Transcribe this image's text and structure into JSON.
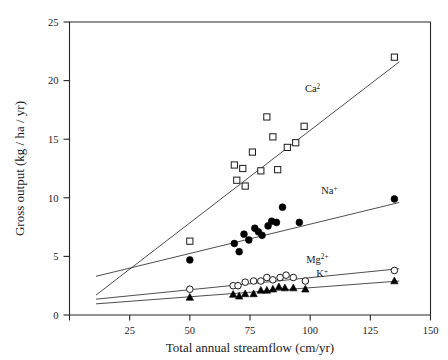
{
  "chart_data": {
    "type": "scatter",
    "title": "",
    "xlabel": "Total annual streamflow (cm/yr)",
    "ylabel": "Gross output (kg / ha / yr)",
    "xlim": [
      0,
      150
    ],
    "ylim": [
      0,
      25
    ],
    "xticks": [
      0,
      25,
      50,
      75,
      100,
      125,
      150
    ],
    "xticklabels": [
      "",
      "25",
      "50",
      "75",
      "100",
      "125",
      "150"
    ],
    "yticks": [
      0,
      5,
      10,
      15,
      20,
      25
    ],
    "yticklabels": [
      "0",
      "5",
      "10",
      "15",
      "20",
      "25"
    ],
    "grid": false,
    "legend_position": "inline-annotations",
    "series": [
      {
        "name": "Ca2",
        "label_text": "Ca",
        "label_sup": "2",
        "marker": "open-square",
        "label_x": 101,
        "label_y": 19.0,
        "trendline": {
          "x0": 11,
          "y0": 1.7,
          "x1": 137,
          "y1": 21.6
        },
        "points": [
          {
            "x": 50.0,
            "y": 6.3
          },
          {
            "x": 68.5,
            "y": 12.8
          },
          {
            "x": 69.5,
            "y": 11.5
          },
          {
            "x": 72.0,
            "y": 12.5
          },
          {
            "x": 73.0,
            "y": 11.0
          },
          {
            "x": 76.0,
            "y": 13.9
          },
          {
            "x": 79.5,
            "y": 12.3
          },
          {
            "x": 82.0,
            "y": 16.9
          },
          {
            "x": 84.5,
            "y": 15.2
          },
          {
            "x": 86.5,
            "y": 12.4
          },
          {
            "x": 90.5,
            "y": 14.3
          },
          {
            "x": 94.0,
            "y": 14.7
          },
          {
            "x": 97.5,
            "y": 16.1
          },
          {
            "x": 135.0,
            "y": 22.0
          }
        ]
      },
      {
        "name": "Na+",
        "label_text": "Na",
        "label_sup": "+",
        "marker": "filled-circle",
        "label_x": 108,
        "label_y": 10.3,
        "trendline": {
          "x0": 11,
          "y0": 3.3,
          "x1": 137,
          "y1": 9.6
        },
        "points": [
          {
            "x": 50.0,
            "y": 4.7
          },
          {
            "x": 68.5,
            "y": 6.1
          },
          {
            "x": 70.5,
            "y": 5.4
          },
          {
            "x": 72.5,
            "y": 6.9
          },
          {
            "x": 74.5,
            "y": 6.4
          },
          {
            "x": 77.0,
            "y": 7.4
          },
          {
            "x": 78.5,
            "y": 7.1
          },
          {
            "x": 80.0,
            "y": 6.8
          },
          {
            "x": 82.5,
            "y": 7.6
          },
          {
            "x": 84.0,
            "y": 8.0
          },
          {
            "x": 86.0,
            "y": 7.9
          },
          {
            "x": 88.5,
            "y": 9.2
          },
          {
            "x": 95.5,
            "y": 7.9
          },
          {
            "x": 135.0,
            "y": 9.9
          }
        ]
      },
      {
        "name": "Mg2+",
        "label_text": "Mg",
        "label_sup": "2+",
        "marker": "open-circle",
        "label_x": 103,
        "label_y": 4.45,
        "trendline": {
          "x0": 11,
          "y0": 1.35,
          "x1": 137,
          "y1": 3.95
        },
        "points": [
          {
            "x": 50.0,
            "y": 2.2
          },
          {
            "x": 68.0,
            "y": 2.5
          },
          {
            "x": 70.0,
            "y": 2.5
          },
          {
            "x": 73.0,
            "y": 2.8
          },
          {
            "x": 76.5,
            "y": 2.9
          },
          {
            "x": 79.5,
            "y": 2.9
          },
          {
            "x": 82.0,
            "y": 3.2
          },
          {
            "x": 84.5,
            "y": 3.0
          },
          {
            "x": 87.5,
            "y": 3.2
          },
          {
            "x": 90.0,
            "y": 3.4
          },
          {
            "x": 93.0,
            "y": 3.2
          },
          {
            "x": 98.0,
            "y": 2.9
          },
          {
            "x": 135.0,
            "y": 3.8
          }
        ]
      },
      {
        "name": "K+",
        "label_text": "K",
        "label_sup": "+",
        "marker": "filled-triangle",
        "label_x": 105,
        "label_y": 3.2,
        "trendline": {
          "x0": 11,
          "y0": 0.95,
          "x1": 137,
          "y1": 2.9
        },
        "points": [
          {
            "x": 50.0,
            "y": 1.5
          },
          {
            "x": 68.0,
            "y": 1.75
          },
          {
            "x": 70.5,
            "y": 1.6
          },
          {
            "x": 73.0,
            "y": 1.8
          },
          {
            "x": 76.5,
            "y": 1.8
          },
          {
            "x": 79.5,
            "y": 2.1
          },
          {
            "x": 82.0,
            "y": 2.1
          },
          {
            "x": 84.5,
            "y": 2.2
          },
          {
            "x": 87.0,
            "y": 2.4
          },
          {
            "x": 89.5,
            "y": 2.3
          },
          {
            "x": 93.0,
            "y": 2.3
          },
          {
            "x": 98.0,
            "y": 2.2
          },
          {
            "x": 135.0,
            "y": 2.9
          }
        ]
      }
    ]
  }
}
